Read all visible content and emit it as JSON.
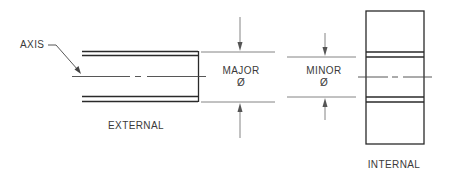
{
  "diagram": {
    "labels": {
      "axis": "AXIS",
      "major": "MAJOR",
      "major_symbol": "Ø",
      "minor": "MINOR",
      "minor_symbol": "Ø",
      "external": "EXTERNAL",
      "internal": "INTERNAL"
    },
    "colors": {
      "line": "#2a2a2a",
      "dimension_line": "#555555",
      "text": "#3a3a3a",
      "background": "#ffffff"
    }
  }
}
